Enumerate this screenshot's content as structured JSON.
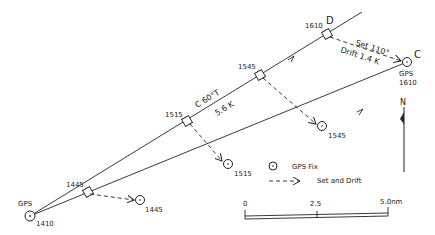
{
  "diagram": {
    "start": {
      "label_top": "GPS",
      "time": "1410"
    },
    "dr_track": {
      "course_label": "C 60°T",
      "speed_label": "5.6 K",
      "dr_positions": [
        "1445",
        "1515",
        "1545",
        "1610"
      ],
      "end_label": "D"
    },
    "gps_track": {
      "fixes": [
        "1445",
        "1515",
        "1545"
      ],
      "end_label": "C",
      "end_gps": "GPS",
      "end_time": "1610"
    },
    "set_drift": {
      "set": "Set 110°",
      "drift": "Drift 1.4 K"
    },
    "legend": {
      "gps_fix": "GPS Fix",
      "set_and_drift": "Set and Drift"
    },
    "north": "N",
    "scale": {
      "ticks": [
        "0",
        "2.5",
        "5.0nm"
      ]
    },
    "colors": {
      "ink": "#222222",
      "background": "#ffffff"
    }
  }
}
